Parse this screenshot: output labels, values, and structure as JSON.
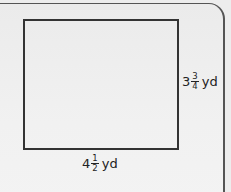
{
  "figure": {
    "shape": "rectangle",
    "height_label": {
      "whole": "3",
      "numerator": "3",
      "denominator": "4",
      "unit": "yd"
    },
    "width_label": {
      "whole": "4",
      "numerator": "1",
      "denominator": "2",
      "unit": "yd"
    }
  },
  "colors": {
    "background": "#ededed",
    "stroke": "#333333",
    "text": "#222222"
  }
}
